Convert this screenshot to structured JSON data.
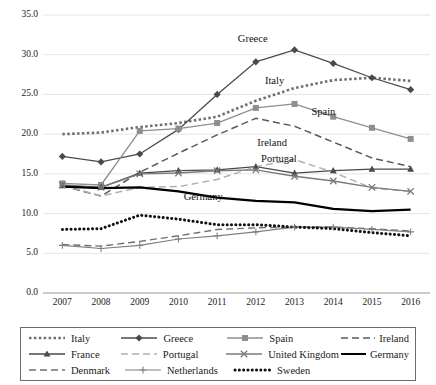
{
  "chart_data": {
    "type": "line",
    "title": "",
    "xlabel": "",
    "ylabel": "",
    "x": [
      2007,
      2008,
      2009,
      2010,
      2011,
      2012,
      2013,
      2014,
      2015,
      2016
    ],
    "categories": [
      "2007",
      "2008",
      "2009",
      "2010",
      "2011",
      "2012",
      "2013",
      "2014",
      "2015",
      "2016"
    ],
    "ylim": [
      0,
      35
    ],
    "ytick_values": [
      0,
      5,
      10,
      15,
      20,
      25,
      30,
      35
    ],
    "ytick_labels": [
      "0.0",
      "5.0",
      "10.0",
      "15.0",
      "20.0",
      "25.0",
      "30.0",
      "35.0"
    ],
    "grid": true,
    "legend_position": "bottom",
    "series": [
      {
        "name": "Italy",
        "values": [
          20.0,
          20.2,
          20.9,
          21.4,
          22.2,
          24.2,
          25.8,
          26.8,
          27.1,
          26.7
        ],
        "style": "dotted",
        "marker": "none",
        "color": "#6f6f6f",
        "width": 2.6,
        "label_in_chart": true
      },
      {
        "name": "Greece",
        "values": [
          17.2,
          16.5,
          17.5,
          20.6,
          25.0,
          29.1,
          30.6,
          28.9,
          27.1,
          25.6
        ],
        "style": "solid",
        "marker": "diamond",
        "color": "#4a4a4a",
        "width": 1.3,
        "label_in_chart": true
      },
      {
        "name": "Spain",
        "values": [
          13.8,
          13.6,
          20.4,
          20.7,
          21.4,
          23.3,
          23.8,
          22.2,
          20.8,
          19.4
        ],
        "style": "solid",
        "marker": "square",
        "color": "#8e8e8e",
        "width": 1.3,
        "label_in_chart": true
      },
      {
        "name": "Ireland",
        "values": [
          13.5,
          12.2,
          15.2,
          17.6,
          19.9,
          22.0,
          21.0,
          19.0,
          17.0,
          15.9
        ],
        "style": "dashed",
        "marker": "none",
        "color": "#5a5a5a",
        "width": 1.5,
        "label_in_chart": true
      },
      {
        "name": "France",
        "values": [
          13.5,
          13.3,
          15.1,
          15.4,
          15.5,
          15.9,
          15.1,
          15.4,
          15.6,
          15.6
        ],
        "style": "solid",
        "marker": "triangle",
        "color": "#4a4a4a",
        "width": 1.3,
        "label_in_chart": false
      },
      {
        "name": "Portugal",
        "values": [
          13.6,
          12.2,
          13.3,
          13.4,
          14.3,
          15.9,
          16.8,
          15.2,
          13.2,
          12.8
        ],
        "style": "dashed",
        "marker": "none",
        "color": "#b0b0b0",
        "width": 1.5,
        "label_in_chart": true
      },
      {
        "name": "United Kingdom",
        "values": [
          13.6,
          13.3,
          15.0,
          15.1,
          15.4,
          15.5,
          14.7,
          14.1,
          13.3,
          12.8
        ],
        "style": "solid",
        "marker": "x",
        "color": "#7a7a7a",
        "width": 1.4,
        "label_in_chart": false
      },
      {
        "name": "Germany",
        "values": [
          13.4,
          13.2,
          13.3,
          12.8,
          12.0,
          11.6,
          11.4,
          10.6,
          10.3,
          10.5
        ],
        "style": "solid",
        "marker": "none",
        "color": "#000000",
        "width": 2.2,
        "label_in_chart": true
      },
      {
        "name": "Denmark",
        "values": [
          6.1,
          5.9,
          6.5,
          7.2,
          8.0,
          8.2,
          8.3,
          8.3,
          8.1,
          7.8
        ],
        "style": "dashed",
        "marker": "none",
        "color": "#707070",
        "width": 1.4,
        "label_in_chart": false
      },
      {
        "name": "Netherlands",
        "values": [
          6.0,
          5.6,
          6.0,
          6.8,
          7.2,
          7.7,
          8.3,
          8.3,
          8.0,
          7.7
        ],
        "style": "solid",
        "marker": "plus",
        "color": "#808080",
        "width": 1.2,
        "label_in_chart": false
      },
      {
        "name": "Sweden",
        "values": [
          8.0,
          8.1,
          9.8,
          9.3,
          8.6,
          8.6,
          8.3,
          8.1,
          7.6,
          7.2
        ],
        "style": "dotted-bold",
        "marker": "none",
        "color": "#111111",
        "width": 3.0,
        "label_in_chart": false
      }
    ],
    "inline_labels": [
      {
        "text": "Greece",
        "x": 2012.0,
        "y": 31.9
      },
      {
        "text": "Italy",
        "x": 2012.7,
        "y": 26.6
      },
      {
        "text": "Spain",
        "x": 2013.9,
        "y": 22.6
      },
      {
        "text": "Ireland",
        "x": 2012.5,
        "y": 18.8
      },
      {
        "text": "Portugal",
        "x": 2012.6,
        "y": 16.8
      },
      {
        "text": "Germany",
        "x": 2010.6,
        "y": 12.0
      }
    ]
  },
  "legend": {
    "rows": [
      [
        {
          "name": "Italy",
          "style": "dotted",
          "marker": "none"
        },
        {
          "name": "Greece",
          "style": "solid",
          "marker": "diamond"
        },
        {
          "name": "Spain",
          "style": "solid",
          "marker": "square"
        },
        {
          "name": "Ireland",
          "style": "dashed",
          "marker": "none"
        }
      ],
      [
        {
          "name": "France",
          "style": "solid",
          "marker": "triangle"
        },
        {
          "name": "Portugal",
          "style": "dashed",
          "marker": "none"
        },
        {
          "name": "United Kingdom",
          "style": "solid",
          "marker": "x"
        },
        {
          "name": "Germany",
          "style": "solid",
          "marker": "none"
        }
      ],
      [
        {
          "name": "Denmark",
          "style": "dashed",
          "marker": "none"
        },
        {
          "name": "Netherlands",
          "style": "solid",
          "marker": "plus"
        },
        {
          "name": "Sweden",
          "style": "dotted-bold",
          "marker": "none"
        }
      ]
    ]
  },
  "axis": {
    "y_labels": [
      "35.0",
      "30.0",
      "25.0",
      "20.0",
      "15.0",
      "10.0",
      "5.0",
      "0.0"
    ],
    "x_labels": [
      "2007",
      "2008",
      "2009",
      "2010",
      "2011",
      "2012",
      "2013",
      "2014",
      "2015",
      "2016"
    ]
  },
  "colors": {
    "grid": "#d9d9d9",
    "axis": "#9a9a9a",
    "text": "#1a1a1a",
    "legend_border": "#6b6b6b"
  }
}
